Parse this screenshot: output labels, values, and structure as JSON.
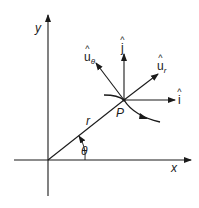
{
  "diagram": {
    "type": "polar-unit-vectors",
    "colors": {
      "stroke": "#1a1a1a",
      "background": "#ffffff"
    },
    "axes": {
      "x_label": "x",
      "y_label": "y"
    },
    "point": {
      "label": "P"
    },
    "radius": {
      "label": "r"
    },
    "angle": {
      "label": "θ"
    },
    "vectors": {
      "i_hat": {
        "base": "i",
        "sub": ""
      },
      "j_hat": {
        "base": "j",
        "sub": ""
      },
      "u_r": {
        "base": "u",
        "sub": "r"
      },
      "u_theta": {
        "base": "u",
        "sub": "θ"
      }
    }
  }
}
